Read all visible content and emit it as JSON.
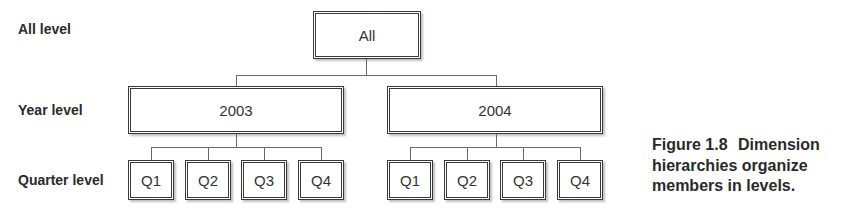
{
  "levels": {
    "all": "All level",
    "year": "Year level",
    "quarter": "Quarter level"
  },
  "nodes": {
    "root": "All",
    "years": [
      {
        "label": "2003",
        "quarters": [
          "Q1",
          "Q2",
          "Q3",
          "Q4"
        ]
      },
      {
        "label": "2004",
        "quarters": [
          "Q1",
          "Q2",
          "Q3",
          "Q4"
        ]
      }
    ]
  },
  "caption": {
    "figure": "Figure 1.8",
    "line1": "Dimension",
    "line2": "hierarchies organize",
    "line3": "members in levels."
  }
}
